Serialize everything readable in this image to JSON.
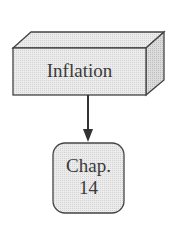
{
  "diagram": {
    "top_node": {
      "label": "Inflation",
      "shape": "3d-box"
    },
    "bottom_node": {
      "line1": "Chap.",
      "line2": "14",
      "shape": "rounded-rectangle"
    },
    "edge": {
      "from": "top_node",
      "to": "bottom_node",
      "type": "arrow"
    }
  },
  "colors": {
    "fill": "#e6e6e6",
    "stroke": "#444444",
    "text": "#3a3a3a"
  }
}
